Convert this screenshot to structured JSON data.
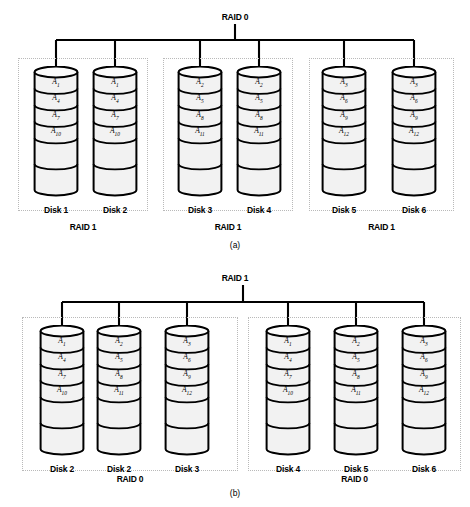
{
  "figure": {
    "caption_a": "(a)",
    "caption_b": "(b)"
  },
  "panel_a": {
    "root_label": "RAID 0",
    "groups": [
      {
        "label": "RAID 1"
      },
      {
        "label": "RAID 1"
      },
      {
        "label": "RAID 1"
      }
    ],
    "disks": [
      {
        "name": "Disk 1",
        "stripes": [
          "A",
          "A",
          "A",
          "A"
        ],
        "subs": [
          "1",
          "4",
          "7",
          "10"
        ]
      },
      {
        "name": "Disk 2",
        "stripes": [
          "A",
          "A",
          "A",
          "A"
        ],
        "subs": [
          "1",
          "4",
          "7",
          "10"
        ]
      },
      {
        "name": "Disk 3",
        "stripes": [
          "A",
          "A",
          "A",
          "A"
        ],
        "subs": [
          "2",
          "5",
          "8",
          "11"
        ]
      },
      {
        "name": "Disk 4",
        "stripes": [
          "A",
          "A",
          "A",
          "A"
        ],
        "subs": [
          "2",
          "5",
          "8",
          "11"
        ]
      },
      {
        "name": "Disk 5",
        "stripes": [
          "A",
          "A",
          "A",
          "A"
        ],
        "subs": [
          "3",
          "6",
          "9",
          "12"
        ]
      },
      {
        "name": "Disk 6",
        "stripes": [
          "A",
          "A",
          "A",
          "A"
        ],
        "subs": [
          "3",
          "6",
          "9",
          "12"
        ]
      }
    ]
  },
  "panel_b": {
    "root_label": "RAID 1",
    "groups": [
      {
        "label": "RAID 0"
      },
      {
        "label": "RAID 0"
      }
    ],
    "disks": [
      {
        "name": "Disk 2",
        "stripes": [
          "A",
          "A",
          "A",
          "A"
        ],
        "subs": [
          "1",
          "4",
          "7",
          "10"
        ]
      },
      {
        "name": "Disk 2",
        "stripes": [
          "A",
          "A",
          "A",
          "A"
        ],
        "subs": [
          "2",
          "5",
          "8",
          "11"
        ]
      },
      {
        "name": "Disk 3",
        "stripes": [
          "A",
          "A",
          "A",
          "A"
        ],
        "subs": [
          "3",
          "6",
          "9",
          "12"
        ]
      },
      {
        "name": "Disk 4",
        "stripes": [
          "A",
          "A",
          "A",
          "A"
        ],
        "subs": [
          "1",
          "4",
          "7",
          "10"
        ]
      },
      {
        "name": "Disk 5",
        "stripes": [
          "A",
          "A",
          "A",
          "A"
        ],
        "subs": [
          "2",
          "5",
          "8",
          "11"
        ]
      },
      {
        "name": "Disk 6",
        "stripes": [
          "A",
          "A",
          "A",
          "A"
        ],
        "subs": [
          "3",
          "6",
          "9",
          "12"
        ]
      }
    ]
  },
  "style": {
    "stroke": "#000000",
    "band_fill": "#f2f2f2",
    "dashed_border": "#b9b9b9"
  }
}
